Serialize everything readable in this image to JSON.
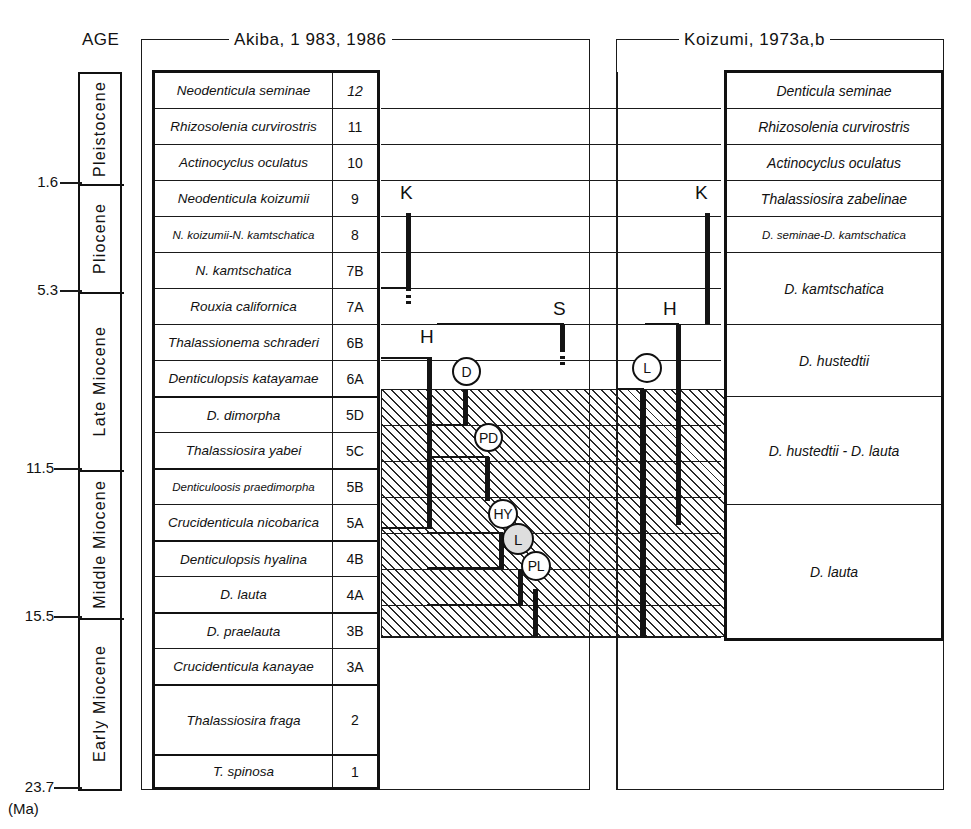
{
  "axis": {
    "title": "AGE",
    "unit": "(Ma)",
    "ticks": [
      "1.6",
      "5.3",
      "11.5",
      "15.5",
      "23.7"
    ],
    "epochs": [
      {
        "label": "Pleistocene"
      },
      {
        "label": "Pliocene"
      },
      {
        "label": "Late Miocene"
      },
      {
        "label": "Middle Miocene"
      },
      {
        "label": "Early Miocene"
      }
    ]
  },
  "headers": {
    "left": "Akiba, 1 983, 1986",
    "right": "Koizumi, 1973a,b"
  },
  "akiba_zones": [
    {
      "name": "Neodenticula seminae",
      "num": "12"
    },
    {
      "name": "Rhizosolenia curvirostris",
      "num": "11"
    },
    {
      "name": "Actinocyclus oculatus",
      "num": "10"
    },
    {
      "name": "Neodenticula koizumii",
      "num": "9"
    },
    {
      "name": "N. koizumii-N. kamtschatica",
      "num": "8"
    },
    {
      "name": "N. kamtschatica",
      "num": "7B"
    },
    {
      "name": "Rouxia californica",
      "num": "7A"
    },
    {
      "name": "Thalassionema schraderi",
      "num": "6B"
    },
    {
      "name": "Denticulopsis katayamae",
      "num": "6A"
    },
    {
      "name": "D. dimorpha",
      "num": "5D"
    },
    {
      "name": "Thalassiosira yabei",
      "num": "5C"
    },
    {
      "name": "Denticuloosis praedimorpha",
      "num": "5B"
    },
    {
      "name": "Crucidenticula nicobarica",
      "num": "5A"
    },
    {
      "name": "Denticulopsis hyalina",
      "num": "4B"
    },
    {
      "name": "D. lauta",
      "num": "4A"
    },
    {
      "name": "D. praelauta",
      "num": "3B"
    },
    {
      "name": "Crucidenticula kanayae",
      "num": "3A"
    },
    {
      "name": "Thalassiosira fraga",
      "num": "2"
    },
    {
      "name": "T. spinosa",
      "num": "1"
    }
  ],
  "koizumi_zones": [
    {
      "name": "Denticula seminae"
    },
    {
      "name": "Rhizosolenia curvirostris"
    },
    {
      "name": "Actinocyclus oculatus"
    },
    {
      "name": "Thalassiosira zabelinae"
    },
    {
      "name": "D. seminae-D. kamtschatica"
    },
    {
      "name": "D. kamtschatica"
    },
    {
      "name": "D. hustedtii"
    },
    {
      "name": "D. hustedtii - D. lauta"
    },
    {
      "name": "D. lauta"
    }
  ],
  "bar_labels": {
    "k_left": "K",
    "k_right": "K",
    "s": "S",
    "h_left": "H",
    "h_right": "H"
  },
  "circle_markers": [
    {
      "id": "D",
      "label": "D"
    },
    {
      "id": "PD",
      "label": "PD"
    },
    {
      "id": "HY",
      "label": "HY"
    },
    {
      "id": "L-center",
      "label": "L"
    },
    {
      "id": "PL",
      "label": "PL"
    },
    {
      "id": "L-right",
      "label": "L"
    }
  ],
  "colors": {
    "ink": "#111111",
    "hatch": "#2a2a2a",
    "paper": "#ffffff",
    "marker_shade": "#dedede"
  }
}
